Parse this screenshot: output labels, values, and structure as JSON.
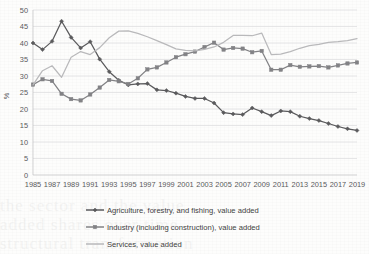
{
  "chart_data": {
    "type": "line",
    "title": "",
    "xlabel": "",
    "ylabel": "%",
    "ylim": [
      0,
      50
    ],
    "ytick_step": 5,
    "yticks": [
      "0",
      "5",
      "10",
      "15",
      "20",
      "25",
      "30",
      "35",
      "40",
      "45",
      "50"
    ],
    "grid": true,
    "legend_position": "bottom",
    "x": [
      1985,
      1986,
      1987,
      1988,
      1989,
      1990,
      1991,
      1992,
      1993,
      1994,
      1995,
      1996,
      1997,
      1998,
      1999,
      2000,
      2001,
      2002,
      2003,
      2004,
      2005,
      2006,
      2007,
      2008,
      2009,
      2010,
      2011,
      2012,
      2013,
      2014,
      2015,
      2016,
      2017,
      2018,
      2019
    ],
    "xtick_labels": [
      "1985",
      "1987",
      "1989",
      "1991",
      "1993",
      "1995",
      "1997",
      "1999",
      "2001",
      "2003",
      "2005",
      "2007",
      "2009",
      "2011",
      "2013",
      "2015",
      "2017",
      "2019"
    ],
    "series": [
      {
        "name": "Agriculture, forestry, and fishing, value added",
        "color": "#5a5a5c",
        "marker": "diamond",
        "values": [
          40.0,
          38.0,
          40.5,
          46.6,
          41.7,
          38.5,
          40.4,
          35.1,
          31.3,
          28.7,
          27.3,
          27.6,
          27.7,
          25.8,
          25.6,
          24.8,
          23.8,
          23.2,
          23.2,
          21.8,
          18.9,
          18.5,
          18.3,
          20.3,
          19.2,
          18.0,
          19.4,
          19.2,
          17.8,
          17.1,
          16.5,
          15.6,
          14.7,
          14.0,
          13.5
        ]
      },
      {
        "name": "Industry (including construction), value added",
        "color": "#828285",
        "marker": "square",
        "values": [
          27.4,
          29.0,
          28.5,
          24.6,
          23.0,
          22.6,
          24.4,
          26.5,
          28.8,
          28.4,
          27.6,
          29.3,
          32.0,
          32.6,
          34.1,
          35.7,
          36.6,
          37.4,
          38.8,
          40.1,
          38.0,
          38.5,
          38.3,
          37.2,
          37.6,
          31.9,
          31.9,
          33.3,
          32.8,
          32.9,
          33.0,
          32.6,
          33.2,
          33.8,
          34.1
        ]
      },
      {
        "name": "Services, value added",
        "color": "#b9b9bb",
        "marker": "none",
        "values": [
          27.3,
          31.6,
          33.1,
          29.6,
          35.7,
          37.4,
          36.5,
          38.6,
          41.6,
          43.6,
          43.7,
          42.9,
          41.9,
          40.7,
          39.5,
          38.2,
          37.8,
          37.6,
          38.1,
          38.8,
          40.2,
          42.3,
          42.3,
          42.2,
          43.0,
          36.5,
          36.6,
          37.4,
          38.4,
          39.2,
          39.6,
          40.2,
          40.4,
          40.7,
          41.3
        ]
      }
    ]
  },
  "legend": {
    "items": [
      {
        "label": "Agriculture, forestry, and fishing, value added"
      },
      {
        "label": "Industry (including construction), value added"
      },
      {
        "label": "Services, value added"
      }
    ]
  },
  "ghost": {
    "line1": "the sector and the value",
    "line2": "added shares over time",
    "line3": "structural transformation"
  }
}
